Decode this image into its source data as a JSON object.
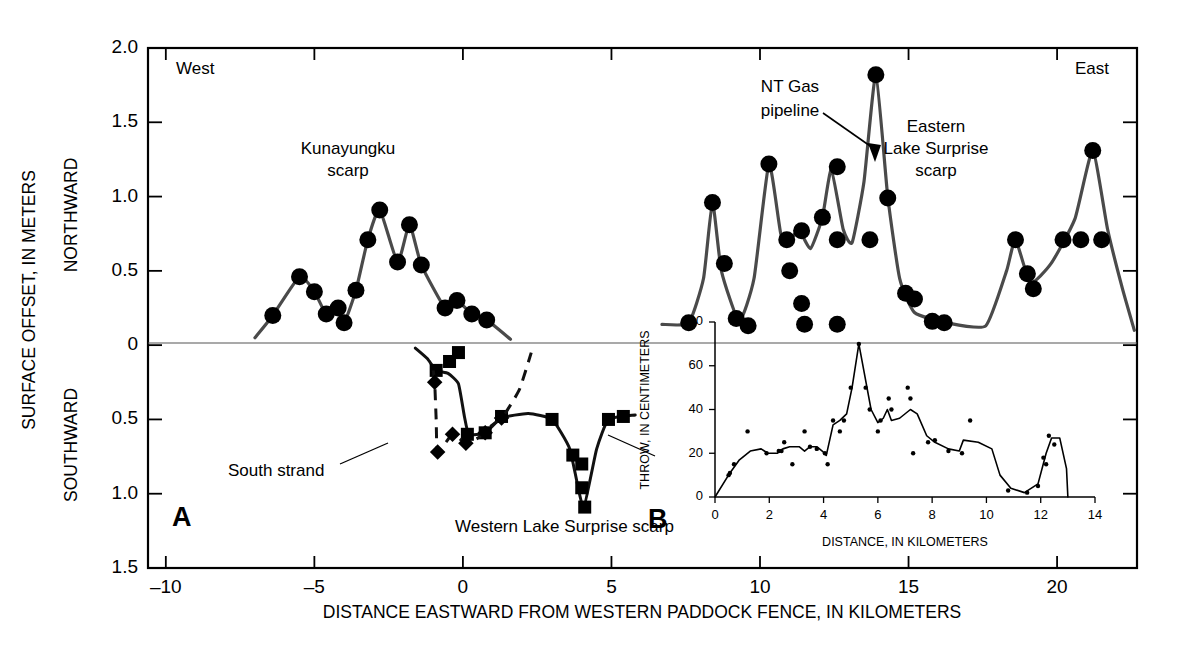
{
  "figure": {
    "xlabel": "DISTANCE EASTWARD FROM WESTERN PADDOCK FENCE, IN KILOMETERS",
    "ylabel_main": "SURFACE OFFSET, IN METERS",
    "ylabel_upper": "NORTHWARD",
    "ylabel_lower": "SOUTHWARD",
    "panel_a_label": "A",
    "panel_b_label": "B",
    "west_label": "West",
    "east_label": "East",
    "annotations": {
      "kunayungku": "Kunayungku\nscarp",
      "kunayungku_line1": "Kunayungku",
      "kunayungku_line2": "scarp",
      "ntgas_line1": "NT Gas",
      "ntgas_line2": "pipeline",
      "eastern_line1": "Eastern",
      "eastern_line2": "Lake Surprise",
      "eastern_line3": "scarp",
      "south_strand": "South strand",
      "western_scarp": "Western Lake Surprise scarp"
    },
    "axis_ticks": {
      "x": [
        "-10",
        "-5",
        "0",
        "5",
        "10",
        "15",
        "20"
      ],
      "y_upper": [
        "2.0",
        "1.5",
        "1.0",
        "0.5",
        "0"
      ],
      "y_lower": [
        "0.5",
        "1.0",
        "1.5"
      ]
    },
    "inset": {
      "xlabel": "DISTANCE, IN KILOMETERS",
      "ylabel": "THROW, IN CENTIMETERS",
      "x_ticks": [
        "0",
        "2",
        "4",
        "6",
        "8",
        "10",
        "12",
        "14"
      ],
      "y_ticks": [
        "0",
        "20",
        "40",
        "60",
        "80"
      ]
    }
  },
  "chart_data": [
    {
      "type": "scatter",
      "id": "panel-a-northward",
      "title": "Surface offset, northward (panel A, Kunayungku scarp)",
      "xlabel": "DISTANCE EASTWARD FROM WESTERN PADDOCK FENCE, IN KILOMETERS",
      "ylabel": "SURFACE OFFSET, IN METERS (NORTHWARD)",
      "xlim": [
        -10.6,
        22.7
      ],
      "ylim": [
        -1.5,
        2.0
      ],
      "grid": false,
      "legend": "none",
      "marker": "filled-circle",
      "points": [
        {
          "x": -6.4,
          "y": 0.2
        },
        {
          "x": -5.5,
          "y": 0.46
        },
        {
          "x": -5.0,
          "y": 0.36
        },
        {
          "x": -4.6,
          "y": 0.21
        },
        {
          "x": -4.2,
          "y": 0.25
        },
        {
          "x": -4.0,
          "y": 0.15
        },
        {
          "x": -3.6,
          "y": 0.37
        },
        {
          "x": -3.2,
          "y": 0.71
        },
        {
          "x": -2.8,
          "y": 0.91
        },
        {
          "x": -2.2,
          "y": 0.56
        },
        {
          "x": -1.8,
          "y": 0.81
        },
        {
          "x": -1.4,
          "y": 0.54
        },
        {
          "x": -0.6,
          "y": 0.25
        },
        {
          "x": -0.2,
          "y": 0.3
        },
        {
          "x": 0.3,
          "y": 0.21
        },
        {
          "x": 0.8,
          "y": 0.17
        }
      ],
      "curve": [
        {
          "x": -7.0,
          "y": 0.05
        },
        {
          "x": -6.4,
          "y": 0.2
        },
        {
          "x": -5.5,
          "y": 0.46
        },
        {
          "x": -5.0,
          "y": 0.36
        },
        {
          "x": -4.6,
          "y": 0.21
        },
        {
          "x": -4.2,
          "y": 0.25
        },
        {
          "x": -4.0,
          "y": 0.15
        },
        {
          "x": -3.6,
          "y": 0.37
        },
        {
          "x": -3.2,
          "y": 0.71
        },
        {
          "x": -2.8,
          "y": 0.91
        },
        {
          "x": -2.2,
          "y": 0.56
        },
        {
          "x": -1.8,
          "y": 0.81
        },
        {
          "x": -1.4,
          "y": 0.54
        },
        {
          "x": -0.6,
          "y": 0.25
        },
        {
          "x": -0.2,
          "y": 0.3
        },
        {
          "x": 0.3,
          "y": 0.21
        },
        {
          "x": 0.8,
          "y": 0.17
        },
        {
          "x": 1.6,
          "y": 0.04
        }
      ]
    },
    {
      "type": "scatter",
      "id": "panel-a-southward-main",
      "title": "Surface offset, southward — Western Lake Surprise scarp (squares)",
      "marker": "filled-square",
      "line_style": "solid",
      "points": [
        {
          "x": -0.9,
          "y": -0.17
        },
        {
          "x": -0.45,
          "y": -0.11
        },
        {
          "x": -0.15,
          "y": -0.05
        },
        {
          "x": 0.15,
          "y": -0.6
        },
        {
          "x": 0.75,
          "y": -0.59
        },
        {
          "x": 1.3,
          "y": -0.48
        },
        {
          "x": 3.0,
          "y": -0.5
        },
        {
          "x": 3.7,
          "y": -0.74
        },
        {
          "x": 4.0,
          "y": -0.8
        },
        {
          "x": 4.0,
          "y": -0.96
        },
        {
          "x": 4.1,
          "y": -1.09
        },
        {
          "x": 4.9,
          "y": -0.5
        },
        {
          "x": 5.4,
          "y": -0.48
        }
      ],
      "curve": [
        {
          "x": -1.6,
          "y": -0.02
        },
        {
          "x": -1.2,
          "y": -0.09
        },
        {
          "x": -0.9,
          "y": -0.17
        },
        {
          "x": -0.5,
          "y": -0.19
        },
        {
          "x": -0.15,
          "y": -0.26
        },
        {
          "x": 0.05,
          "y": -0.48
        },
        {
          "x": 0.2,
          "y": -0.6
        },
        {
          "x": 0.75,
          "y": -0.59
        },
        {
          "x": 1.3,
          "y": -0.49
        },
        {
          "x": 2.2,
          "y": -0.46
        },
        {
          "x": 3.0,
          "y": -0.5
        },
        {
          "x": 3.6,
          "y": -0.7
        },
        {
          "x": 4.05,
          "y": -1.09
        },
        {
          "x": 4.5,
          "y": -0.7
        },
        {
          "x": 4.9,
          "y": -0.5
        },
        {
          "x": 5.8,
          "y": -0.47
        }
      ]
    },
    {
      "type": "scatter",
      "id": "panel-a-south-strand",
      "title": "South strand (diamonds, dashed line)",
      "marker": "filled-diamond",
      "line_style": "dashed",
      "points": [
        {
          "x": -0.95,
          "y": -0.25
        },
        {
          "x": -0.85,
          "y": -0.72
        },
        {
          "x": -0.35,
          "y": -0.6
        },
        {
          "x": 0.1,
          "y": -0.66
        },
        {
          "x": 0.75,
          "y": -0.59
        },
        {
          "x": 1.3,
          "y": -0.49
        }
      ],
      "curve": [
        {
          "x": -1.0,
          "y": -0.17
        },
        {
          "x": -0.95,
          "y": -0.25
        },
        {
          "x": -0.9,
          "y": -0.5
        },
        {
          "x": -0.85,
          "y": -0.72
        },
        {
          "x": -0.35,
          "y": -0.6
        },
        {
          "x": 0.1,
          "y": -0.66
        },
        {
          "x": 0.55,
          "y": -0.62
        },
        {
          "x": 0.9,
          "y": -0.55
        },
        {
          "x": 1.35,
          "y": -0.48
        },
        {
          "x": 1.9,
          "y": -0.3
        },
        {
          "x": 2.3,
          "y": -0.05
        }
      ]
    },
    {
      "type": "scatter",
      "id": "panel-a-northward-east",
      "title": "Surface offset, northward — Eastern Lake Surprise scarp",
      "marker": "filled-circle",
      "points": [
        {
          "x": 7.6,
          "y": 0.15
        },
        {
          "x": 8.4,
          "y": 0.96
        },
        {
          "x": 8.8,
          "y": 0.55
        },
        {
          "x": 9.2,
          "y": 0.18
        },
        {
          "x": 9.6,
          "y": 0.13
        },
        {
          "x": 10.3,
          "y": 1.22
        },
        {
          "x": 10.9,
          "y": 0.71
        },
        {
          "x": 11.0,
          "y": 0.5
        },
        {
          "x": 11.4,
          "y": 0.77
        },
        {
          "x": 11.4,
          "y": 0.28
        },
        {
          "x": 11.5,
          "y": 0.14
        },
        {
          "x": 12.1,
          "y": 0.86
        },
        {
          "x": 12.6,
          "y": 1.2
        },
        {
          "x": 12.6,
          "y": 0.71
        },
        {
          "x": 12.6,
          "y": 0.14
        },
        {
          "x": 13.9,
          "y": 1.82
        },
        {
          "x": 13.7,
          "y": 0.71
        },
        {
          "x": 14.3,
          "y": 0.99
        },
        {
          "x": 14.9,
          "y": 0.35
        },
        {
          "x": 15.2,
          "y": 0.31
        },
        {
          "x": 15.8,
          "y": 0.16
        },
        {
          "x": 16.2,
          "y": 0.15
        },
        {
          "x": 18.6,
          "y": 0.71
        },
        {
          "x": 19.0,
          "y": 0.48
        },
        {
          "x": 19.2,
          "y": 0.38
        },
        {
          "x": 21.2,
          "y": 1.31
        },
        {
          "x": 20.2,
          "y": 0.71
        },
        {
          "x": 20.8,
          "y": 0.71
        },
        {
          "x": 21.5,
          "y": 0.71
        }
      ],
      "curve": [
        {
          "x": 6.7,
          "y": 0.14
        },
        {
          "x": 7.6,
          "y": 0.15
        },
        {
          "x": 8.1,
          "y": 0.45
        },
        {
          "x": 8.4,
          "y": 0.96
        },
        {
          "x": 8.7,
          "y": 0.5
        },
        {
          "x": 9.3,
          "y": 0.16
        },
        {
          "x": 9.8,
          "y": 0.45
        },
        {
          "x": 10.3,
          "y": 1.22
        },
        {
          "x": 10.7,
          "y": 0.75
        },
        {
          "x": 11.0,
          "y": 0.7
        },
        {
          "x": 11.3,
          "y": 0.78
        },
        {
          "x": 11.7,
          "y": 0.65
        },
        {
          "x": 12.1,
          "y": 0.86
        },
        {
          "x": 12.4,
          "y": 1.18
        },
        {
          "x": 12.8,
          "y": 0.78
        },
        {
          "x": 13.1,
          "y": 0.69
        },
        {
          "x": 13.5,
          "y": 1.1
        },
        {
          "x": 13.9,
          "y": 1.82
        },
        {
          "x": 14.3,
          "y": 1.0
        },
        {
          "x": 14.7,
          "y": 0.45
        },
        {
          "x": 15.2,
          "y": 0.22
        },
        {
          "x": 16.3,
          "y": 0.15
        },
        {
          "x": 17.6,
          "y": 0.13
        },
        {
          "x": 18.3,
          "y": 0.5
        },
        {
          "x": 18.6,
          "y": 0.71
        },
        {
          "x": 19.1,
          "y": 0.42
        },
        {
          "x": 19.8,
          "y": 0.55
        },
        {
          "x": 20.6,
          "y": 0.85
        },
        {
          "x": 21.2,
          "y": 1.31
        },
        {
          "x": 21.7,
          "y": 0.78
        },
        {
          "x": 22.2,
          "y": 0.38
        },
        {
          "x": 22.6,
          "y": 0.1
        }
      ]
    },
    {
      "type": "scatter",
      "id": "panel-b-throw",
      "title": "Throw profile (inset B)",
      "xlabel": "DISTANCE, IN KILOMETERS",
      "ylabel": "THROW, IN CENTIMETERS",
      "xlim": [
        0,
        14
      ],
      "ylim": [
        0,
        80
      ],
      "grid": false,
      "marker": "small-dot",
      "points": [
        {
          "x": 0.5,
          "y": 10
        },
        {
          "x": 0.55,
          "y": 11
        },
        {
          "x": 0.7,
          "y": 15
        },
        {
          "x": 1.2,
          "y": 30
        },
        {
          "x": 1.9,
          "y": 20
        },
        {
          "x": 2.35,
          "y": 21
        },
        {
          "x": 2.45,
          "y": 21
        },
        {
          "x": 2.55,
          "y": 25
        },
        {
          "x": 2.85,
          "y": 15
        },
        {
          "x": 3.3,
          "y": 30
        },
        {
          "x": 3.5,
          "y": 23
        },
        {
          "x": 3.75,
          "y": 22
        },
        {
          "x": 4.05,
          "y": 20
        },
        {
          "x": 4.15,
          "y": 15
        },
        {
          "x": 4.35,
          "y": 35
        },
        {
          "x": 4.6,
          "y": 30
        },
        {
          "x": 4.75,
          "y": 35
        },
        {
          "x": 5.0,
          "y": 50
        },
        {
          "x": 5.3,
          "y": 70
        },
        {
          "x": 5.55,
          "y": 50
        },
        {
          "x": 5.7,
          "y": 40
        },
        {
          "x": 6.0,
          "y": 30
        },
        {
          "x": 6.1,
          "y": 35
        },
        {
          "x": 6.4,
          "y": 45
        },
        {
          "x": 6.5,
          "y": 40
        },
        {
          "x": 7.1,
          "y": 50
        },
        {
          "x": 7.2,
          "y": 45
        },
        {
          "x": 7.3,
          "y": 20
        },
        {
          "x": 7.85,
          "y": 25
        },
        {
          "x": 8.1,
          "y": 26
        },
        {
          "x": 8.6,
          "y": 21
        },
        {
          "x": 9.1,
          "y": 20
        },
        {
          "x": 9.4,
          "y": 35
        },
        {
          "x": 10.8,
          "y": 3
        },
        {
          "x": 11.5,
          "y": 2
        },
        {
          "x": 11.9,
          "y": 5
        },
        {
          "x": 12.1,
          "y": 18
        },
        {
          "x": 12.2,
          "y": 15
        },
        {
          "x": 12.3,
          "y": 28
        },
        {
          "x": 12.5,
          "y": 24
        }
      ],
      "curve": [
        {
          "x": 0.0,
          "y": 0
        },
        {
          "x": 0.55,
          "y": 11
        },
        {
          "x": 0.9,
          "y": 17
        },
        {
          "x": 1.3,
          "y": 21
        },
        {
          "x": 1.7,
          "y": 22
        },
        {
          "x": 1.95,
          "y": 20
        },
        {
          "x": 2.3,
          "y": 20
        },
        {
          "x": 2.5,
          "y": 22
        },
        {
          "x": 2.75,
          "y": 23
        },
        {
          "x": 3.1,
          "y": 23
        },
        {
          "x": 3.3,
          "y": 21
        },
        {
          "x": 3.5,
          "y": 23
        },
        {
          "x": 3.75,
          "y": 23
        },
        {
          "x": 3.95,
          "y": 21
        },
        {
          "x": 4.1,
          "y": 19
        },
        {
          "x": 4.35,
          "y": 33
        },
        {
          "x": 4.6,
          "y": 35
        },
        {
          "x": 4.85,
          "y": 38
        },
        {
          "x": 5.05,
          "y": 50
        },
        {
          "x": 5.3,
          "y": 70
        },
        {
          "x": 5.6,
          "y": 50
        },
        {
          "x": 5.75,
          "y": 40
        },
        {
          "x": 6.0,
          "y": 34
        },
        {
          "x": 6.2,
          "y": 36
        },
        {
          "x": 6.35,
          "y": 40
        },
        {
          "x": 6.5,
          "y": 35
        },
        {
          "x": 6.8,
          "y": 36
        },
        {
          "x": 7.2,
          "y": 40
        },
        {
          "x": 7.45,
          "y": 38
        },
        {
          "x": 7.8,
          "y": 28
        },
        {
          "x": 8.1,
          "y": 25
        },
        {
          "x": 8.6,
          "y": 22
        },
        {
          "x": 9.0,
          "y": 21
        },
        {
          "x": 9.15,
          "y": 26
        },
        {
          "x": 9.7,
          "y": 25
        },
        {
          "x": 10.2,
          "y": 22
        },
        {
          "x": 10.5,
          "y": 10
        },
        {
          "x": 10.9,
          "y": 4
        },
        {
          "x": 11.4,
          "y": 2
        },
        {
          "x": 11.9,
          "y": 6
        },
        {
          "x": 12.2,
          "y": 20
        },
        {
          "x": 12.4,
          "y": 27
        },
        {
          "x": 12.7,
          "y": 27
        },
        {
          "x": 12.95,
          "y": 13
        },
        {
          "x": 13.0,
          "y": 0
        }
      ]
    }
  ]
}
